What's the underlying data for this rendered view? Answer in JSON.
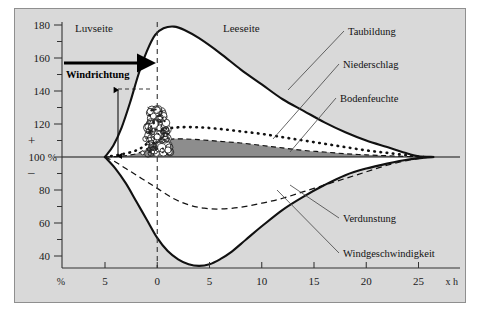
{
  "figure": {
    "background_color": "#d9d9d9",
    "frame_color": "#8f8f8f",
    "page_color": "#ffffff"
  },
  "axes": {
    "y_unit_label": "%",
    "x_unit_label": "x h",
    "plus_sign": "+",
    "minus_sign": "–",
    "y_baseline_label": "100 %",
    "y_ticks_major": [
      "180",
      "160",
      "140",
      "120",
      "80",
      "60",
      "40"
    ],
    "x_ticks": [
      "5",
      "0",
      "5",
      "10",
      "15",
      "20",
      "25"
    ]
  },
  "annotations": {
    "luvseite": "Luvseite",
    "leeseite": "Leeseite",
    "windrichtung": "Windrichtung"
  },
  "curve_labels": [
    {
      "name": "taubildung",
      "text": "Taubildung"
    },
    {
      "name": "niederschlag",
      "text": "Niederschlag"
    },
    {
      "name": "bodenfeuchte",
      "text": "Bodenfeuchte"
    },
    {
      "name": "verdunstung",
      "text": "Verdunstung"
    },
    {
      "name": "windgeschwindigkeit",
      "text": "Windgeschwindigkeit"
    }
  ],
  "chart_data": {
    "type": "line",
    "title": "",
    "subtitle": "",
    "xlabel": "x h",
    "ylabel": "%",
    "xlim": [
      -7,
      27
    ],
    "ylim": [
      30,
      185
    ],
    "grid": false,
    "legend": "inline-leader-labels",
    "baseline": 100,
    "x_tick_values": [
      -5,
      0,
      5,
      10,
      15,
      20,
      25
    ],
    "x_tick_labels": [
      "5",
      "0",
      "5",
      "10",
      "15",
      "20",
      "25"
    ],
    "y_tick_values": [
      180,
      170,
      160,
      150,
      140,
      130,
      120,
      110,
      100,
      90,
      80,
      70,
      60,
      50,
      40
    ],
    "y_tick_labels_major": {
      "180": "180",
      "160": "160",
      "140": "140",
      "120": "120",
      "100": "100 %",
      "80": "80",
      "60": "60",
      "40": "40"
    },
    "annotations": [
      {
        "text": "Luvseite",
        "x": -4.2,
        "y": 179,
        "note": "windward side (left of hedge)"
      },
      {
        "text": "Leeseite",
        "x": 5.0,
        "y": 179,
        "note": "leeward side (right of hedge)"
      },
      {
        "text": "Windrichtung",
        "x": -4.6,
        "y": 160,
        "note": "wind direction, bold, with thick right arrow above"
      },
      {
        "text": "hedge-height-arrow",
        "x": -3.7,
        "y": 100,
        "note": "vertical double arrow from 100% up to ~145%, dashed tie line to hedge top"
      },
      {
        "text": "hedge-illustration",
        "x": 0,
        "y": 100,
        "note": "shrub/hedge drawing standing at x = 0"
      },
      {
        "text": "vertical-dashed-line",
        "x": 0,
        "y": 100,
        "note": "dashed vertical line through hedge position"
      }
    ],
    "series": [
      {
        "name": "Taubildung",
        "style": "solid-thick-upper",
        "label": "Taubildung",
        "points": [
          [
            -5,
            100
          ],
          [
            -4.2,
            107
          ],
          [
            -3.4,
            118
          ],
          [
            -2.6,
            133
          ],
          [
            -1.8,
            150
          ],
          [
            -1.0,
            164
          ],
          [
            -0.2,
            174
          ],
          [
            0.6,
            178
          ],
          [
            1.6,
            179
          ],
          [
            2.6,
            177
          ],
          [
            4.0,
            172
          ],
          [
            6.0,
            163
          ],
          [
            8.0,
            153
          ],
          [
            10.0,
            144
          ],
          [
            12.0,
            135
          ],
          [
            14.0,
            128
          ],
          [
            16.0,
            121
          ],
          [
            18.0,
            115
          ],
          [
            20.0,
            110
          ],
          [
            22.0,
            106
          ],
          [
            24.0,
            102
          ],
          [
            25.0,
            100.5
          ],
          [
            26.5,
            100
          ]
        ]
      },
      {
        "name": "Niederschlag",
        "style": "dotted",
        "label": "Niederschlag",
        "points": [
          [
            -5,
            100
          ],
          [
            -3.5,
            101.5
          ],
          [
            -2.0,
            104
          ],
          [
            -1.0,
            108
          ],
          [
            0.0,
            114
          ],
          [
            1.0,
            117
          ],
          [
            2.0,
            118
          ],
          [
            4.0,
            118
          ],
          [
            6.0,
            117
          ],
          [
            8.0,
            115.5
          ],
          [
            10.0,
            114
          ],
          [
            12.0,
            112
          ],
          [
            14.0,
            110
          ],
          [
            16.0,
            108
          ],
          [
            18.0,
            106
          ],
          [
            20.0,
            104
          ],
          [
            22.0,
            102.5
          ],
          [
            24.0,
            101
          ],
          [
            25.5,
            100
          ]
        ]
      },
      {
        "name": "Bodenfeuchte",
        "style": "dashed-upper-plus-dark-fill",
        "label": "Bodenfeuchte",
        "points": [
          [
            -5,
            100
          ],
          [
            -3.5,
            100.5
          ],
          [
            -2.0,
            102
          ],
          [
            -1.0,
            105
          ],
          [
            0.0,
            109
          ],
          [
            1.0,
            110.5
          ],
          [
            2.0,
            111
          ],
          [
            4.0,
            110.5
          ],
          [
            6.0,
            109.5
          ],
          [
            8.0,
            108.5
          ],
          [
            10.0,
            107
          ],
          [
            12.0,
            105.5
          ],
          [
            14.0,
            104
          ],
          [
            16.0,
            103
          ],
          [
            18.0,
            102
          ],
          [
            20.0,
            101.3
          ],
          [
            22.0,
            100.8
          ],
          [
            24.0,
            100.3
          ],
          [
            25.5,
            100
          ]
        ]
      },
      {
        "name": "Verdunstung",
        "style": "dashed-lower",
        "label": "Verdunstung",
        "points": [
          [
            -5,
            100
          ],
          [
            -4.0,
            97
          ],
          [
            -3.0,
            93
          ],
          [
            -2.0,
            89
          ],
          [
            -1.0,
            85
          ],
          [
            0.0,
            81
          ],
          [
            1.5,
            75
          ],
          [
            3.0,
            71
          ],
          [
            4.5,
            69
          ],
          [
            6.0,
            68.5
          ],
          [
            8.0,
            69.5
          ],
          [
            10.0,
            72
          ],
          [
            12.0,
            75
          ],
          [
            14.0,
            79
          ],
          [
            16.0,
            83
          ],
          [
            18.0,
            87
          ],
          [
            20.0,
            91
          ],
          [
            22.0,
            95
          ],
          [
            24.0,
            98
          ],
          [
            25.5,
            99.5
          ],
          [
            26.5,
            100
          ]
        ]
      },
      {
        "name": "Windgeschwindigkeit",
        "style": "solid-thick-lower",
        "label": "Windgeschwindigkeit",
        "points": [
          [
            -5,
            100
          ],
          [
            -4.0,
            93
          ],
          [
            -3.0,
            84
          ],
          [
            -2.0,
            73
          ],
          [
            -1.0,
            62
          ],
          [
            0.0,
            51
          ],
          [
            1.0,
            43
          ],
          [
            2.0,
            38
          ],
          [
            3.0,
            35
          ],
          [
            4.0,
            34
          ],
          [
            5.0,
            35
          ],
          [
            6.0,
            38
          ],
          [
            7.0,
            42
          ],
          [
            8.5,
            50
          ],
          [
            10.0,
            58
          ],
          [
            12.0,
            68
          ],
          [
            14.0,
            76
          ],
          [
            16.0,
            83
          ],
          [
            18.0,
            89
          ],
          [
            20.0,
            93
          ],
          [
            22.0,
            96
          ],
          [
            24.0,
            98.5
          ],
          [
            25.5,
            99.5
          ],
          [
            26.5,
            100
          ]
        ]
      }
    ]
  }
}
